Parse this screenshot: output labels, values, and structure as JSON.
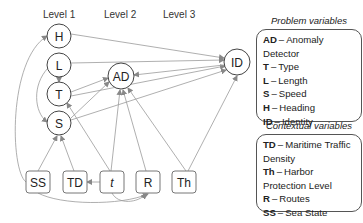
{
  "levels": [
    "Level 1",
    "Level 2",
    "Level 3"
  ],
  "nodes": {
    "H": {
      "label": "H"
    },
    "L": {
      "label": "L"
    },
    "T": {
      "label": "T"
    },
    "S": {
      "label": "S"
    },
    "AD": {
      "label": "AD"
    },
    "ID": {
      "label": "ID"
    },
    "SS": {
      "label": "SS"
    },
    "TD": {
      "label": "TD"
    },
    "t": {
      "label": "t"
    },
    "R": {
      "label": "R"
    },
    "Th": {
      "label": "Th"
    }
  },
  "problem_legend": {
    "title": "Problem variables",
    "items": [
      {
        "abbr": "AD",
        "desc": "Anomaly Detector"
      },
      {
        "abbr": "T",
        "desc": "Type"
      },
      {
        "abbr": "L",
        "desc": "Length"
      },
      {
        "abbr": "S",
        "desc": "Speed"
      },
      {
        "abbr": "H",
        "desc": "Heading"
      },
      {
        "abbr": "ID",
        "desc": "Identity"
      }
    ]
  },
  "contextual_legend": {
    "title": "Contextual variables",
    "items": [
      {
        "abbr": "TD",
        "desc": "Maritime Traffic Density"
      },
      {
        "abbr": "Th",
        "desc": "Harbor Protection Level"
      },
      {
        "abbr": "R",
        "desc": "Routes"
      },
      {
        "abbr": "SS",
        "desc": "Sea State"
      },
      {
        "abbr": "t",
        "desc": "Time"
      }
    ]
  },
  "dash": "–",
  "colors": {
    "edge": "#9a9a9a",
    "node_stroke": "#444444",
    "box_stroke": "#777777"
  }
}
